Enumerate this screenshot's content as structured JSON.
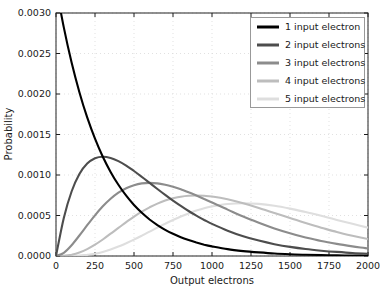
{
  "figure": {
    "background": "#ffffff",
    "frame_color": "#222222",
    "grid_color": "#d9d9d9",
    "legend_border_color": "#999999"
  },
  "chart_data": {
    "type": "line",
    "title": "",
    "xlabel": "Output electrons",
    "ylabel": "Probability",
    "xlim": [
      0,
      2000
    ],
    "ylim": [
      0,
      0.003
    ],
    "grid": true,
    "grid_style": "dotted",
    "legend_position": "upper right",
    "xticks": [
      0,
      250,
      500,
      750,
      1000,
      1250,
      1500,
      1750,
      2000
    ],
    "xtick_labels": [
      "0",
      "250",
      "500",
      "750",
      "1000",
      "1250",
      "1500",
      "1750",
      "2000"
    ],
    "yticks": [
      0,
      0.0005,
      0.001,
      0.0015,
      0.002,
      0.0025,
      0.003
    ],
    "ytick_labels": [
      "0.0000",
      "0.0005",
      "0.0010",
      "0.0015",
      "0.0020",
      "0.0025",
      "0.0030"
    ],
    "x": [
      0,
      50,
      100,
      150,
      200,
      250,
      300,
      350,
      400,
      450,
      500,
      550,
      600,
      650,
      700,
      750,
      800,
      850,
      900,
      950,
      1000,
      1100,
      1200,
      1300,
      1400,
      1500,
      1600,
      1700,
      1800,
      1900,
      2000
    ],
    "series": [
      {
        "name": "1 input electron",
        "color": "#000000",
        "values": [
          0.003333,
          0.002822,
          0.002388,
          0.002022,
          0.001711,
          0.001449,
          0.001226,
          0.001038,
          0.000879,
          0.000744,
          0.00063,
          0.000533,
          0.000451,
          0.000382,
          0.000323,
          0.000274,
          0.000232,
          0.000196,
          0.000166,
          0.00014,
          0.000119,
          8.5e-05,
          6.1e-05,
          4.4e-05,
          3.1e-05,
          2.2e-05,
          1.6e-05,
          1.2e-05,
          8e-06,
          6e-06,
          4e-06
        ]
      },
      {
        "name": "2 input electrons",
        "color": "#4d4d4d",
        "values": [
          0,
          0.00047,
          0.000796,
          0.001011,
          0.001141,
          0.001207,
          0.001226,
          0.001211,
          0.001172,
          0.001116,
          0.001049,
          0.000977,
          0.000902,
          0.000827,
          0.000754,
          0.000684,
          0.000618,
          0.000555,
          0.000498,
          0.000445,
          0.000396,
          0.000312,
          0.000244,
          0.00019,
          0.000146,
          0.000112,
          8.6e-05,
          6.5e-05,
          5e-05,
          3.7e-05,
          2.8e-05
        ]
      },
      {
        "name": "3 input electrons",
        "color": "#8c8c8c",
        "values": [
          0,
          3.9e-05,
          0.000133,
          0.000253,
          0.00038,
          0.000503,
          0.000613,
          0.000706,
          0.000781,
          0.000837,
          0.000874,
          0.000896,
          0.000902,
          0.000896,
          0.00088,
          0.000855,
          0.000823,
          0.000787,
          0.000747,
          0.000704,
          0.000661,
          0.000573,
          0.000488,
          0.000411,
          0.000341,
          0.000281,
          0.000229,
          0.000185,
          0.000149,
          0.000119,
          9.4e-05
        ]
      },
      {
        "name": "4 input electrons",
        "color": "#bdbdbd",
        "values": [
          0,
          2e-06,
          1.5e-05,
          4.2e-05,
          8.5e-05,
          0.00014,
          0.000204,
          0.000275,
          0.000347,
          0.000418,
          0.000486,
          0.000547,
          0.000601,
          0.000647,
          0.000684,
          0.000712,
          0.000732,
          0.000743,
          0.000747,
          0.000743,
          0.000734,
          0.0007,
          0.000651,
          0.000593,
          0.000531,
          0.000468,
          0.000407,
          0.00035,
          0.000297,
          0.000251,
          0.00021
        ]
      },
      {
        "name": "5 input electrons",
        "color": "#dedede",
        "values": [
          0,
          0,
          1e-06,
          5e-06,
          1.4e-05,
          2.9e-05,
          5.1e-05,
          8e-05,
          0.000116,
          0.000157,
          0.000202,
          0.000251,
          0.000301,
          0.000351,
          0.000399,
          0.000445,
          0.000488,
          0.000526,
          0.00056,
          0.000589,
          0.000612,
          0.000642,
          0.000651,
          0.000643,
          0.00062,
          0.000585,
          0.000543,
          0.000496,
          0.000446,
          0.000397,
          0.000349
        ]
      }
    ]
  }
}
